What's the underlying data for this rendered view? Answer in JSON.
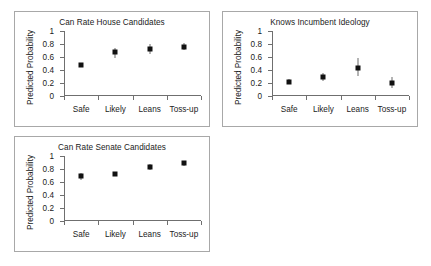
{
  "figure": {
    "background": "#ffffff",
    "panel_border_color": "#a8a8a8",
    "axis_color": "#6f6f6f",
    "marker_color": "#111111",
    "ylabel": "Predicted Probability",
    "ytick_labels": [
      "1",
      "0.8",
      "0.6",
      "0.4",
      "0.2",
      "0"
    ],
    "xtick_labels": [
      "Safe",
      "Likely",
      "Leans",
      "Toss-up"
    ]
  },
  "chart_data": [
    {
      "type": "scatter",
      "panel": "house",
      "title": "Can Rate House Candidates",
      "xlabel": "",
      "ylabel": "Predicted Probability",
      "categories": [
        "Safe",
        "Likely",
        "Leans",
        "Toss-up"
      ],
      "values": [
        0.47,
        0.67,
        0.73,
        0.76
      ],
      "error_low": [
        0.44,
        0.59,
        0.65,
        0.71
      ],
      "error_high": [
        0.5,
        0.74,
        0.8,
        0.81
      ],
      "ylim": [
        0,
        1
      ],
      "yticks": [
        0,
        0.2,
        0.4,
        0.6,
        0.8,
        1
      ],
      "grid": false,
      "legend": "none",
      "errorbars": true
    },
    {
      "type": "scatter",
      "panel": "knows",
      "title": "Knows Incumbent Ideology",
      "xlabel": "",
      "ylabel": "Predicted Probability",
      "categories": [
        "Safe",
        "Likely",
        "Leans",
        "Toss-up"
      ],
      "values": [
        0.22,
        0.29,
        0.43,
        0.2
      ],
      "error_low": [
        0.19,
        0.23,
        0.31,
        0.13
      ],
      "error_high": [
        0.26,
        0.36,
        0.58,
        0.29
      ],
      "ylim": [
        0,
        1
      ],
      "yticks": [
        0,
        0.2,
        0.4,
        0.6,
        0.8,
        1
      ],
      "grid": false,
      "legend": "none",
      "errorbars": true
    },
    {
      "type": "scatter",
      "panel": "senate",
      "title": "Can Rate Senate Candidates",
      "xlabel": "",
      "ylabel": "Predicted Probability",
      "categories": [
        "Safe",
        "Likely",
        "Leans",
        "Toss-up"
      ],
      "values": [
        0.69,
        0.73,
        0.83,
        0.89
      ],
      "error_low": [
        0.63,
        0.71,
        0.78,
        0.85
      ],
      "error_high": [
        0.74,
        0.75,
        0.88,
        0.93
      ],
      "ylim": [
        0,
        1
      ],
      "yticks": [
        0,
        0.2,
        0.4,
        0.6,
        0.8,
        1
      ],
      "grid": false,
      "legend": "none",
      "errorbars": true
    }
  ]
}
